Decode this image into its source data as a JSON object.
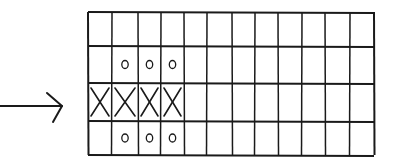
{
  "diagram": {
    "colors": {
      "ink": "#1a1a1a",
      "background": "#ffffff"
    },
    "arrow": {
      "direction": "right",
      "shaft": {
        "x1": 0,
        "y1": 106,
        "x2": 62,
        "y2": 106
      },
      "head": [
        [
          47,
          93
        ],
        [
          62,
          106
        ],
        [
          53,
          122
        ]
      ]
    },
    "grid": {
      "rows": 4,
      "cols": 12,
      "col_lines": [
        88,
        112,
        138,
        161,
        184,
        207,
        232,
        255,
        278,
        302,
        325,
        350,
        374
      ],
      "row_lines": [
        12,
        46,
        83,
        121,
        155
      ]
    },
    "marks": [
      {
        "row": 1,
        "col": 1,
        "symbol": "O"
      },
      {
        "row": 1,
        "col": 2,
        "symbol": "O"
      },
      {
        "row": 1,
        "col": 3,
        "symbol": "O"
      },
      {
        "row": 2,
        "col": 0,
        "symbol": "X"
      },
      {
        "row": 2,
        "col": 1,
        "symbol": "X"
      },
      {
        "row": 2,
        "col": 2,
        "symbol": "X"
      },
      {
        "row": 2,
        "col": 3,
        "symbol": "X"
      },
      {
        "row": 3,
        "col": 1,
        "symbol": "O"
      },
      {
        "row": 3,
        "col": 2,
        "symbol": "O"
      },
      {
        "row": 3,
        "col": 3,
        "symbol": "O"
      }
    ]
  }
}
